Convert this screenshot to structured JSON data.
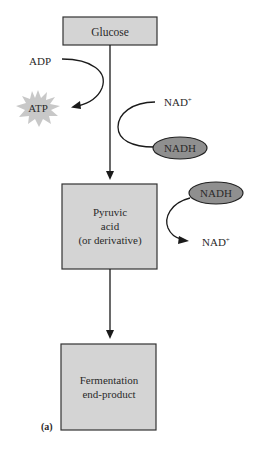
{
  "diagram": {
    "boxes": {
      "glucose": "Glucose",
      "pyruvic": [
        "Pyruvic",
        "acid",
        "(or derivative)"
      ],
      "fermentation": [
        "Fermentation",
        "end-product"
      ]
    },
    "side_reactions": {
      "adp": "ADP",
      "atp": "ATP",
      "nad_plus_top": "NAD",
      "nad_plus_top_sup": "+",
      "nadh_top": "NADH",
      "nadh_bottom": "NADH",
      "nad_plus_bottom": "NAD",
      "nad_plus_bottom_sup": "+"
    },
    "panel_label": "(a)",
    "colors": {
      "box_fill": "#d4d4d4",
      "box_stroke": "#333333",
      "ellipse_fill": "#8f8f8f",
      "starburst_fill": "#c8c8c8",
      "line": "#1a1a1a"
    }
  }
}
